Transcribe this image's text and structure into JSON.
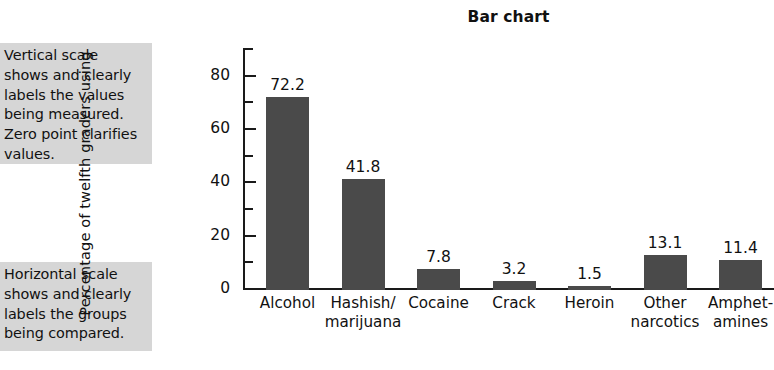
{
  "chart_data": {
    "type": "bar",
    "title": "Bar chart",
    "xlabel": "",
    "ylabel": "Percentage of twelfth graders using",
    "ylim": [
      0,
      90
    ],
    "yticks_major": [
      0,
      20,
      40,
      60,
      80
    ],
    "yticks_minor": [
      10,
      30,
      50,
      70,
      90
    ],
    "grid": false,
    "legend": null,
    "categories": [
      "Alcohol",
      "Hashish/\nmarijuana",
      "Cocaine",
      "Crack",
      "Heroin",
      "Other\nnarcotics",
      "Amphet-\namines"
    ],
    "values": [
      72.2,
      41.8,
      7.8,
      3.2,
      1.5,
      13.1,
      11.4
    ],
    "value_labels": [
      "72.2",
      "41.8",
      "7.8",
      "3.2",
      "1.5",
      "13.1",
      "11.4"
    ],
    "bar_color": "#4a4a4a",
    "axis_color": "#1a1a1a",
    "background": "#ffffff"
  },
  "annotations": {
    "vertical": "Vertical scale\nshows and clearly\nlabels the values\nbeing measured.\nZero point clarifies\nvalues.",
    "horizontal": "Horizontal scale\nshows and clearly\nlabels the groups\nbeing compared.",
    "box_color": "#d6d6d6"
  }
}
